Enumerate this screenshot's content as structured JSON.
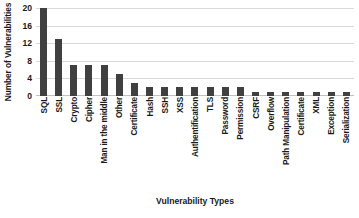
{
  "chart_data": {
    "type": "bar",
    "title": "",
    "xlabel": "Vulnerability Types",
    "ylabel": "Number of Vulnerabilities",
    "ylim": [
      0,
      20
    ],
    "yticks": [
      20,
      16,
      12,
      8,
      4,
      0
    ],
    "grid": true,
    "legend": null,
    "bar_color": "#404040",
    "grid_color": "#d9d9d9",
    "categories": [
      "SQL",
      "SSL",
      "Crypto",
      "Cipher",
      "Man in the middle",
      "Other",
      "Certificate",
      "Hash",
      "SSH",
      "XSS",
      "Authentification",
      "TLS",
      "Password",
      "Permission",
      "CSRF",
      "Overflow",
      "Path Manipulation",
      "Certificate",
      "XML",
      "Exception",
      "Serialization"
    ],
    "values": [
      20,
      13,
      7,
      7,
      7,
      5,
      3,
      2,
      2,
      2,
      2,
      2,
      2,
      2,
      1,
      1,
      1,
      1,
      1,
      1,
      1
    ]
  }
}
